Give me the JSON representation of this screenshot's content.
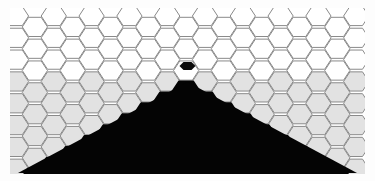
{
  "figure": {
    "title": "Hexagonal lattice with triangular dark region",
    "type": "hex-lattice-diagram",
    "width": 375,
    "height": 181,
    "background_color": "#fdfdfd"
  },
  "colors": {
    "page_background": "#fdfdfd",
    "hex_white_fill": "#ffffff",
    "hex_gray_fill": "#e2e2e2",
    "hex_stroke": "#8a8a8a",
    "dark_region": "#040404",
    "defect_marker": "#0a0a0a",
    "plate_margin": "#f4f4f4"
  },
  "lattice": {
    "orientation": "flat-top",
    "hex_radius": 12.6,
    "hex_width": 25.2,
    "col_pitch": 18.9,
    "row_pitch": 21.82,
    "origin_x": 16.0,
    "origin_y": 16.0,
    "columns": 20,
    "rows": 8,
    "gray_start_row": 3,
    "stroke_width": 1.0
  },
  "dark_region": {
    "shape": "triangle",
    "apex_x": 187.5,
    "apex_y": 74.0,
    "base_y": 173.0,
    "left_base_x": 18.0,
    "right_base_x": 357.0,
    "description": "black triangular void occupying lower-center of lattice"
  },
  "defect": {
    "shape": "small-hexagon",
    "center_x": 187.5,
    "center_y": 66.0,
    "radius_x": 8.0,
    "radius_y": 4.6,
    "description": "small dark hexagonal marker at apex cell"
  },
  "margins": {
    "left": 14,
    "right": 14,
    "top": 10,
    "bottom": 8
  },
  "chart_data": {
    "type": "heatmap",
    "title": "Hexagonal lattice with triangular dark region",
    "xlabel": "",
    "ylabel": "",
    "grid": false,
    "legend": "none",
    "categories": [
      "white-cell",
      "gray-cell",
      "dark-void",
      "defect"
    ],
    "values": [
      52,
      54,
      1,
      1
    ]
  }
}
